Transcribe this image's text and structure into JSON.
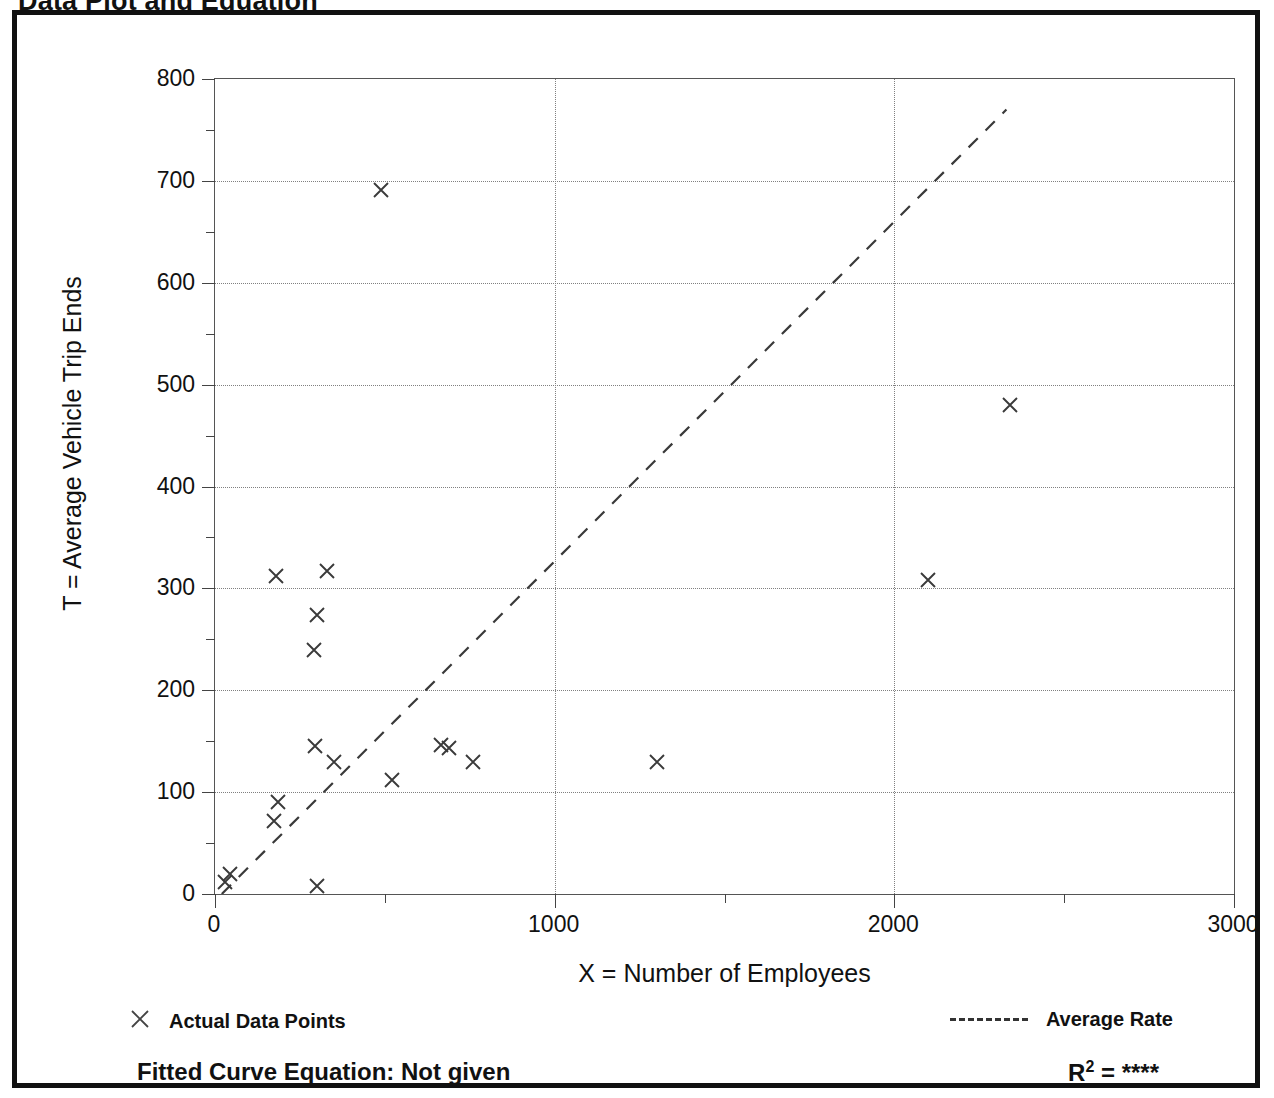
{
  "title": "Data Plot and Equation",
  "chart_data": {
    "type": "scatter",
    "title": "Data Plot and Equation",
    "xlabel": "X = Number of Employees",
    "ylabel": "T = Average Vehicle Trip Ends",
    "xlim": [
      0,
      3000
    ],
    "ylim": [
      0,
      800
    ],
    "xticks": [
      0,
      1000,
      2000,
      3000
    ],
    "yticks": [
      0,
      100,
      200,
      300,
      400,
      500,
      600,
      700,
      800
    ],
    "xtick_labels": [
      "0",
      "1000",
      "2000",
      "3000"
    ],
    "ytick_labels": [
      "0",
      "100",
      "200",
      "300",
      "400",
      "500",
      "600",
      "700",
      "800"
    ],
    "x_minor_interval": 500,
    "y_minor_interval": 50,
    "grid": true,
    "grid_style": "dotted",
    "legend_position": "below-plot",
    "series": [
      {
        "name": "Actual Data Points",
        "marker": "x",
        "points": [
          [
            30,
            12
          ],
          [
            45,
            20
          ],
          [
            180,
            312
          ],
          [
            185,
            90
          ],
          [
            175,
            72
          ],
          [
            290,
            240
          ],
          [
            300,
            274
          ],
          [
            295,
            145
          ],
          [
            300,
            8
          ],
          [
            330,
            317
          ],
          [
            350,
            130
          ],
          [
            490,
            691
          ],
          [
            520,
            112
          ],
          [
            665,
            146
          ],
          [
            690,
            143
          ],
          [
            760,
            130
          ],
          [
            1300,
            130
          ],
          [
            2100,
            308
          ],
          [
            2340,
            480
          ]
        ]
      },
      {
        "name": "Average Rate",
        "marker": "dashed-line",
        "line": [
          [
            20,
            0
          ],
          [
            2330,
            770
          ]
        ]
      }
    ],
    "annotations": {
      "fitted_curve_equation": "Fitted Curve Equation:  Not given",
      "r_squared_label": "R",
      "r_squared_exponent": "2",
      "r_squared_equals": " = ",
      "r_squared_value": "****"
    }
  },
  "legend": {
    "data_points_label": "Actual Data Points",
    "average_rate_label": "Average Rate",
    "marker_icon": "x-marker-icon",
    "line_icon": "dashed-line-icon"
  },
  "footer": {
    "fitted_equation": "Fitted Curve Equation:  Not given",
    "r_base": "R",
    "r_exp": "2",
    "r_eq": " = ",
    "r_value": "****"
  },
  "colors": {
    "ink": "#111111",
    "grid": "#808080",
    "axis": "#555555",
    "background": "#ffffff"
  }
}
